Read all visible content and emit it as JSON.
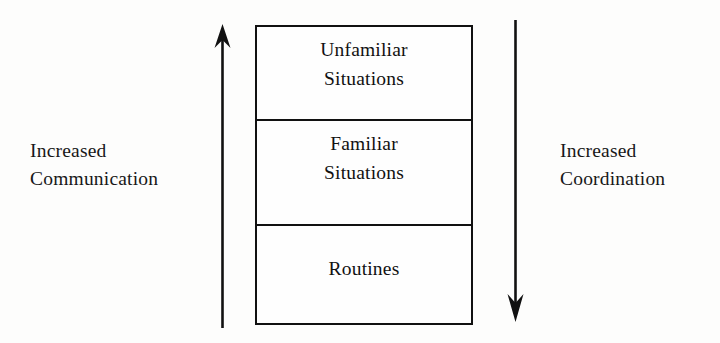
{
  "diagram": {
    "background_color": "#fdfdfc",
    "ink_color": "#111111"
  },
  "left_axis": {
    "label_line1": "Increased",
    "label_line2": "Communication",
    "arrow_direction": "up",
    "arrow_icon": "arrow-up-icon"
  },
  "right_axis": {
    "label_line1": "Increased",
    "label_line2": "Coordination",
    "arrow_direction": "down",
    "arrow_icon": "arrow-down-icon"
  },
  "stack": {
    "bands": [
      {
        "id": "unfamiliar",
        "line1": "Unfamiliar",
        "line2": "Situations"
      },
      {
        "id": "familiar",
        "line1": "Familiar",
        "line2": "Situations"
      },
      {
        "id": "routines",
        "line1": "Routines",
        "line2": ""
      }
    ]
  }
}
